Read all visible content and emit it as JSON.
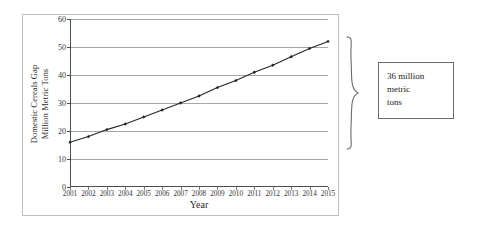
{
  "chart_data": {
    "type": "line",
    "title": "",
    "xlabel": "Year",
    "ylabel": "Domestic Cereals Gap Million Metric Tons",
    "ylabel_line1": "Domestic Cereals Gap",
    "ylabel_line2": "Million Metric Tons",
    "categories": [
      "2001",
      "2002",
      "2003",
      "2004",
      "2005",
      "2006",
      "2007",
      "2008",
      "2009",
      "2010",
      "2011",
      "2012",
      "2013",
      "2014",
      "2015"
    ],
    "values": [
      16,
      18,
      20.5,
      22.5,
      25,
      27.5,
      30,
      32.5,
      35.5,
      38,
      41,
      43.5,
      46.5,
      49.5,
      52
    ],
    "ylim": [
      0,
      60
    ],
    "ytick_values": [
      0,
      10,
      20,
      30,
      40,
      50,
      60
    ],
    "ytick_labels": [
      "0",
      "10",
      "20",
      "30",
      "40",
      "50",
      "60"
    ],
    "grid": true,
    "legend": "none",
    "series_color": "#262626",
    "marker": "diamond"
  },
  "annotation": {
    "brace_name": "right-curly-brace",
    "brace_from_value": 16,
    "brace_to_value": 52,
    "callout_lines": [
      "36 million",
      "metric",
      "tons"
    ],
    "callout_text": "36 million metric tons"
  },
  "colors": {
    "frame_border": "#bfbfbf",
    "gridline": "#a6a6a6",
    "axis": "#4d4d4d",
    "series": "#262626",
    "callout_border": "#6b6b6b",
    "background": "#ffffff",
    "text": "#2a2a2a"
  }
}
